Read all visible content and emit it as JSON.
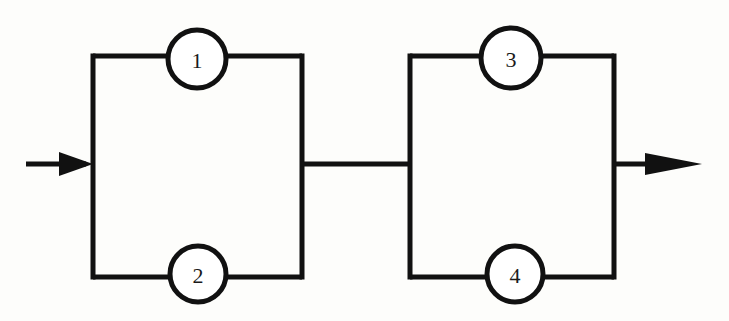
{
  "diagram": {
    "type": "reliability-block-diagram",
    "background_color": "#fdfdfb",
    "line_color": "#111111",
    "node_fill_color": "#ffffff",
    "input_arrow_label": "",
    "output_arrow_label": "",
    "nodes": [
      {
        "id": "node-1",
        "label": "1",
        "cx": 197,
        "cy": 59,
        "r": 29,
        "branch": "top",
        "subsystem": "left"
      },
      {
        "id": "node-2",
        "label": "2",
        "cx": 198,
        "cy": 274,
        "r": 28,
        "branch": "bottom",
        "subsystem": "left"
      },
      {
        "id": "node-3",
        "label": "3",
        "cx": 511,
        "cy": 58,
        "r": 30,
        "branch": "top",
        "subsystem": "right"
      },
      {
        "id": "node-4",
        "label": "4",
        "cx": 515,
        "cy": 274,
        "r": 28,
        "branch": "bottom",
        "subsystem": "right"
      }
    ],
    "subsystems": [
      {
        "id": "subsystem-left",
        "left_x": 93,
        "right_x": 302,
        "top_y": 56,
        "bottom_y": 277,
        "members": [
          "1",
          "2"
        ],
        "configuration": "parallel"
      },
      {
        "id": "subsystem-right",
        "left_x": 410,
        "right_x": 614,
        "top_y": 56,
        "bottom_y": 277,
        "members": [
          "3",
          "4"
        ],
        "configuration": "parallel"
      }
    ],
    "connections": {
      "input_arrow": {
        "x_start": 26,
        "x_end": 93,
        "y": 164
      },
      "middle_link": {
        "x_start": 302,
        "x_end": 410,
        "y": 164
      },
      "output_arrow": {
        "x_start": 614,
        "x_end": 702,
        "y": 164
      }
    }
  }
}
